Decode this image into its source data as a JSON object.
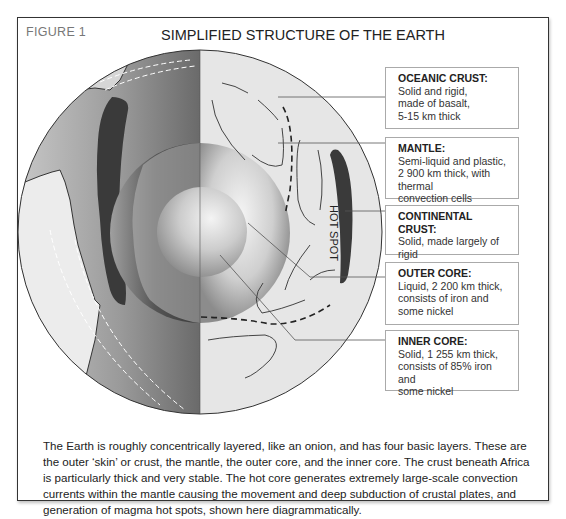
{
  "figure": {
    "label": "FIGURE 1",
    "title": "SIMPLIFIED STRUCTURE OF THE EARTH",
    "north_label": "North Pole",
    "south_label": "South Pole",
    "hot_spot_label": "HOT SPOT"
  },
  "layers": [
    {
      "heading": "OCEANIC CRUST:",
      "lines": [
        "Solid and rigid,",
        "made of basalt,",
        "5-15 km thick"
      ]
    },
    {
      "heading": "MANTLE:",
      "lines": [
        "Semi-liquid and plastic,",
        "2 900 km thick, with thermal",
        "convection cells"
      ]
    },
    {
      "heading": "CONTINENTAL CRUST:",
      "lines": [
        "Solid, made largely of rigid",
        "granite, up to 70 km thick"
      ]
    },
    {
      "heading": "OUTER CORE:",
      "lines": [
        "Liquid, 2 200 km thick,",
        "consists of iron and",
        "some nickel"
      ]
    },
    {
      "heading": "INNER CORE:",
      "lines": [
        "Solid, 1 255 km thick,",
        "consists of 85% iron and",
        "some nickel"
      ]
    }
  ],
  "caption": "The Earth is roughly concentrically layered, like an onion, and has four basic layers. These are the outer ‘skin’ or crust, the mantle, the outer core, and the inner core. The crust beneath Africa is particularly thick and very stable. The hot core generates extremely large-scale convection currents within the mantle causing the movement and deep subduction of crustal plates, and generation of magma hot spots, shown here diagrammatically.",
  "colors": {
    "frame": "#333333",
    "mantle_fill": "#e6e6e6",
    "continental_crust": "#3a3a3a",
    "label_border": "#aaaaaa",
    "figure_label": "#777777"
  }
}
